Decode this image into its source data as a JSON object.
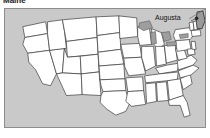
{
  "title": "Maine",
  "map": {
    "name": "united-states-map",
    "highlighted_state": "Maine",
    "city_label": "Augusta",
    "city_marker": "city-dot",
    "colors": {
      "ocean_background": "#c9c9c9",
      "land_fill": "#ffffff",
      "state_border": "#3a3a3a",
      "highlight_fill": "#9a9a9a",
      "lake_fill": "#9e9e9e",
      "frame_border": "#8d8d8d",
      "title_text": "#1a1a1a",
      "label_text": "#111111"
    }
  }
}
